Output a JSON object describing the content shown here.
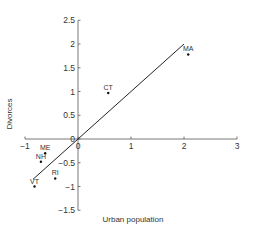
{
  "chart_data": {
    "type": "scatter",
    "title": "",
    "xlabel": "Urban population",
    "ylabel": "Divorces",
    "xlim": [
      -1,
      3
    ],
    "ylim": [
      -1.5,
      2.5
    ],
    "x_ticks": [
      -1,
      0,
      1,
      2,
      3
    ],
    "x_tick_labels": [
      "−1",
      "0",
      "1",
      "2",
      "3"
    ],
    "y_ticks": [
      -1.5,
      -1,
      -0.5,
      0,
      0.5,
      1,
      1.5,
      2,
      2.5
    ],
    "y_tick_labels": [
      "−1.5",
      "−1",
      "−0.5",
      "0",
      "0.5",
      "1",
      "1.5",
      "2",
      "2.5"
    ],
    "grid": false,
    "legend": null,
    "points": [
      {
        "label": "MA",
        "x": 2.08,
        "y": 1.78
      },
      {
        "label": "CT",
        "x": 0.57,
        "y": 0.97
      },
      {
        "label": "ME",
        "x": -0.62,
        "y": -0.3
      },
      {
        "label": "NH",
        "x": -0.7,
        "y": -0.48
      },
      {
        "label": "RI",
        "x": -0.43,
        "y": -0.83
      },
      {
        "label": "VT",
        "x": -0.82,
        "y": -1.0
      }
    ],
    "fit_line": {
      "x": [
        -0.85,
        2.0
      ],
      "y": [
        -0.85,
        2.0
      ]
    }
  },
  "colors": {
    "axis": "#555555",
    "line": "#222222",
    "point": "#111111",
    "text": "#333333"
  }
}
